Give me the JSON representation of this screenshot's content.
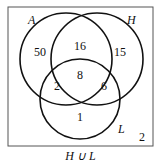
{
  "sets": [
    {
      "name": "A",
      "label": "A"
    },
    {
      "name": "H",
      "label": "H"
    },
    {
      "name": "L",
      "label": "L"
    }
  ],
  "regions": {
    "A_only": "50",
    "A_H": "16",
    "H_only": "15",
    "A_H_L": "8",
    "A_L": "2",
    "H_L": "6",
    "L_only": "1",
    "outside": "2"
  },
  "caption": "H ∪ L"
}
